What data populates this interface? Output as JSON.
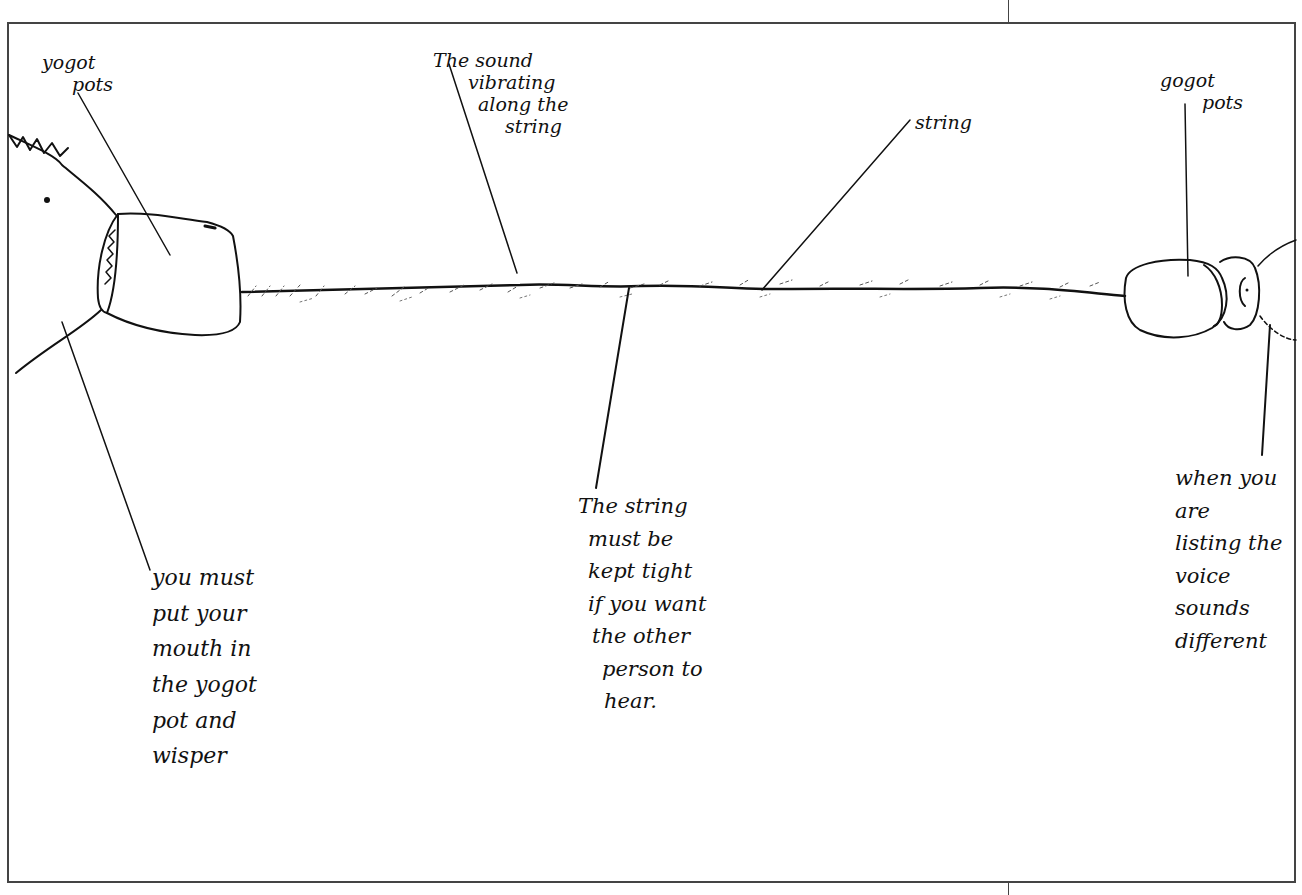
{
  "diagram": {
    "type": "hand-drawn labelled sketch",
    "colors": {
      "ink": "#111111",
      "frame": "#444444",
      "background": "#ffffff"
    }
  },
  "labels": {
    "left_pot": {
      "lines": [
        "yogot",
        "pots"
      ]
    },
    "sound": {
      "lines": [
        "The sound",
        "vibrating",
        "along the",
        "string"
      ]
    },
    "string": {
      "lines": [
        "string"
      ]
    },
    "right_pot": {
      "lines": [
        "gogot",
        "pots"
      ]
    },
    "mouth_note": {
      "lines": [
        "you must",
        "put your",
        "mouth in",
        "the yogot",
        "pot and",
        "wisper"
      ]
    },
    "tight_note": {
      "lines": [
        "The string",
        "must be",
        "kept tight",
        "if you want",
        "the other",
        "person to",
        "hear."
      ]
    },
    "listen_note": {
      "lines": [
        "when you",
        "are",
        "listing the",
        "voice",
        "sounds",
        "different"
      ]
    }
  }
}
